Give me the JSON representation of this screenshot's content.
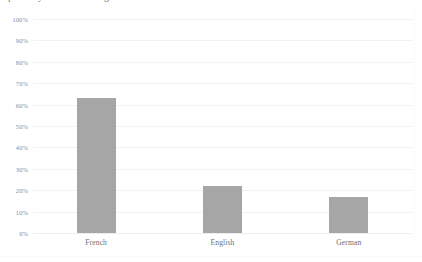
{
  "chart_data": {
    "type": "bar",
    "title": "",
    "xlabel": "",
    "ylabel": "",
    "categories": [
      "French",
      "English",
      "German"
    ],
    "values": [
      63,
      22,
      17
    ],
    "value_labels": [
      "63%",
      "22%",
      "17%"
    ],
    "ylim": [
      0,
      100
    ],
    "ytick_labels": [
      "100%",
      "90%",
      "80%",
      "70%",
      "60%",
      "50%",
      "40%",
      "30%",
      "20%",
      "10%",
      "0%"
    ],
    "ytick_values": [
      100,
      90,
      80,
      70,
      60,
      50,
      40,
      30,
      20,
      10,
      0
    ],
    "grid": true,
    "grid_axis": "y",
    "legend": false,
    "legend_position": "none",
    "series": [
      {
        "name": "Share",
        "values": [
          63,
          22,
          17
        ],
        "color": "#a6a6a6"
      }
    ],
    "annotations": []
  },
  "style": {
    "bar_color": "#a6a6a6",
    "gridline_color": "#f2f2f2",
    "axis_color": "#ededed",
    "tick_label_color": "#8c8c8c",
    "category_label_color": "#6e6e6e",
    "background": "#ffffff"
  },
  "clipped_title": {
    "text": "partially cut off heading line"
  }
}
